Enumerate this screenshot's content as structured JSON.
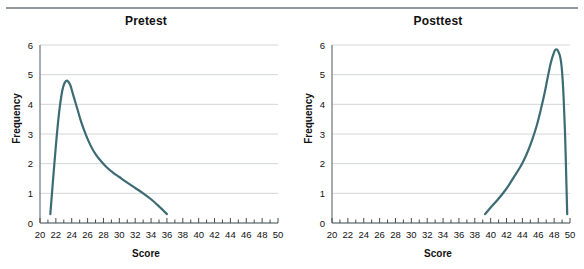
{
  "figure": {
    "background_color": "#ffffff",
    "top_rule_color": "#8d9aa3"
  },
  "chart_data": [
    {
      "type": "line",
      "title": "Pretest",
      "xlabel": "Score",
      "ylabel": "Frequency",
      "xlim": [
        20,
        50
      ],
      "ylim": [
        0,
        6
      ],
      "x_major_step": 2,
      "x_minor_step": 1,
      "y_step": 1,
      "grid": "horizontal",
      "legend": "none",
      "series_color": "#3d6b74",
      "x_tick_labels": [
        "20",
        "22",
        "24",
        "26",
        "28",
        "30",
        "32",
        "34",
        "36",
        "38",
        "40",
        "42",
        "44",
        "46",
        "48",
        "50"
      ],
      "y_tick_labels": [
        "0",
        "1",
        "2",
        "3",
        "4",
        "5",
        "6"
      ],
      "distribution_shape": "right-skewed",
      "peak": {
        "x": 23.4,
        "y": 4.8
      },
      "x": [
        21.3,
        21.6,
        22.0,
        22.4,
        22.8,
        23.1,
        23.4,
        23.8,
        24.2,
        24.7,
        25.2,
        25.8,
        26.4,
        27.0,
        27.7,
        28.4,
        29.2,
        30.0,
        31.0,
        32.0,
        33.0,
        34.0,
        35.0,
        36.0
      ],
      "y": [
        0.3,
        1.3,
        2.6,
        3.7,
        4.45,
        4.72,
        4.8,
        4.66,
        4.3,
        3.85,
        3.4,
        2.96,
        2.6,
        2.32,
        2.08,
        1.88,
        1.7,
        1.55,
        1.36,
        1.18,
        1.0,
        0.8,
        0.56,
        0.3
      ]
    },
    {
      "type": "line",
      "title": "Posttest",
      "xlabel": "Score",
      "ylabel": "Frequency",
      "xlim": [
        20,
        50
      ],
      "ylim": [
        0,
        6
      ],
      "x_major_step": 2,
      "x_minor_step": 1,
      "y_step": 1,
      "grid": "horizontal",
      "legend": "none",
      "series_color": "#3d6b74",
      "x_tick_labels": [
        "20",
        "22",
        "24",
        "26",
        "28",
        "30",
        "32",
        "34",
        "36",
        "38",
        "40",
        "42",
        "44",
        "46",
        "48",
        "50"
      ],
      "y_tick_labels": [
        "0",
        "1",
        "2",
        "3",
        "4",
        "5",
        "6"
      ],
      "distribution_shape": "left-skewed",
      "peak": {
        "x": 48.2,
        "y": 5.85
      },
      "x": [
        39.3,
        40.0,
        40.8,
        41.6,
        42.3,
        43.0,
        43.8,
        44.5,
        45.2,
        45.8,
        46.3,
        46.8,
        47.2,
        47.6,
        48.0,
        48.2,
        48.5,
        48.8,
        49.0,
        49.2,
        49.4,
        49.55,
        49.65
      ],
      "y": [
        0.3,
        0.52,
        0.76,
        1.02,
        1.28,
        1.58,
        1.92,
        2.3,
        2.78,
        3.28,
        3.8,
        4.38,
        4.92,
        5.42,
        5.76,
        5.85,
        5.8,
        5.55,
        5.1,
        4.2,
        2.8,
        1.3,
        0.3
      ]
    }
  ]
}
